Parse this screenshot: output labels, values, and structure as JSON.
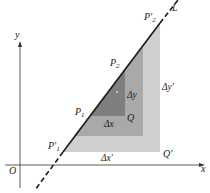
{
  "diagram": {
    "axes": {
      "x_label": "x",
      "y_label": "y",
      "origin_label": "O"
    },
    "line_label": "L",
    "points": {
      "p1_prime": "P′",
      "p1_prime_sub": "1",
      "p2_prime": "P′",
      "p2_prime_sub": "2",
      "p1": "P",
      "p1_sub": "1",
      "p2": "P",
      "p2_sub": "2",
      "q": "Q",
      "q_prime": "Q′"
    },
    "deltas": {
      "dx": "Δx",
      "dy": "Δy",
      "dx_prime": "Δx′",
      "dy_prime": "Δy′"
    },
    "colors": {
      "large_triangle": "#cfcfcf",
      "middle_triangle": "#a9a9a9",
      "small_triangle": "#7f7f7f",
      "line": "#1a1a1a",
      "axes": "#333333"
    }
  }
}
